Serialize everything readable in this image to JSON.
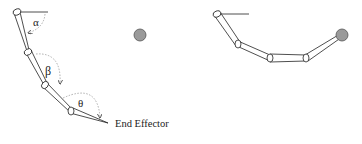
{
  "labels": {
    "alpha": "α",
    "beta": "β",
    "theta": "θ",
    "end_effector": "End Effector"
  },
  "colors": {
    "stroke": "#222222",
    "target_fill": "#9a9a9a",
    "arc": "#999999"
  },
  "left_figure": {
    "joints": [
      [
        17,
        12
      ],
      [
        28,
        52
      ],
      [
        45,
        85
      ],
      [
        71,
        111
      ]
    ],
    "tip": [
      108,
      123
    ],
    "target": [
      140,
      35
    ]
  },
  "right_figure": {
    "joints": [
      [
        217,
        14
      ],
      [
        238,
        44
      ],
      [
        270,
        58
      ],
      [
        306,
        58
      ]
    ],
    "target": [
      342,
      35
    ]
  }
}
